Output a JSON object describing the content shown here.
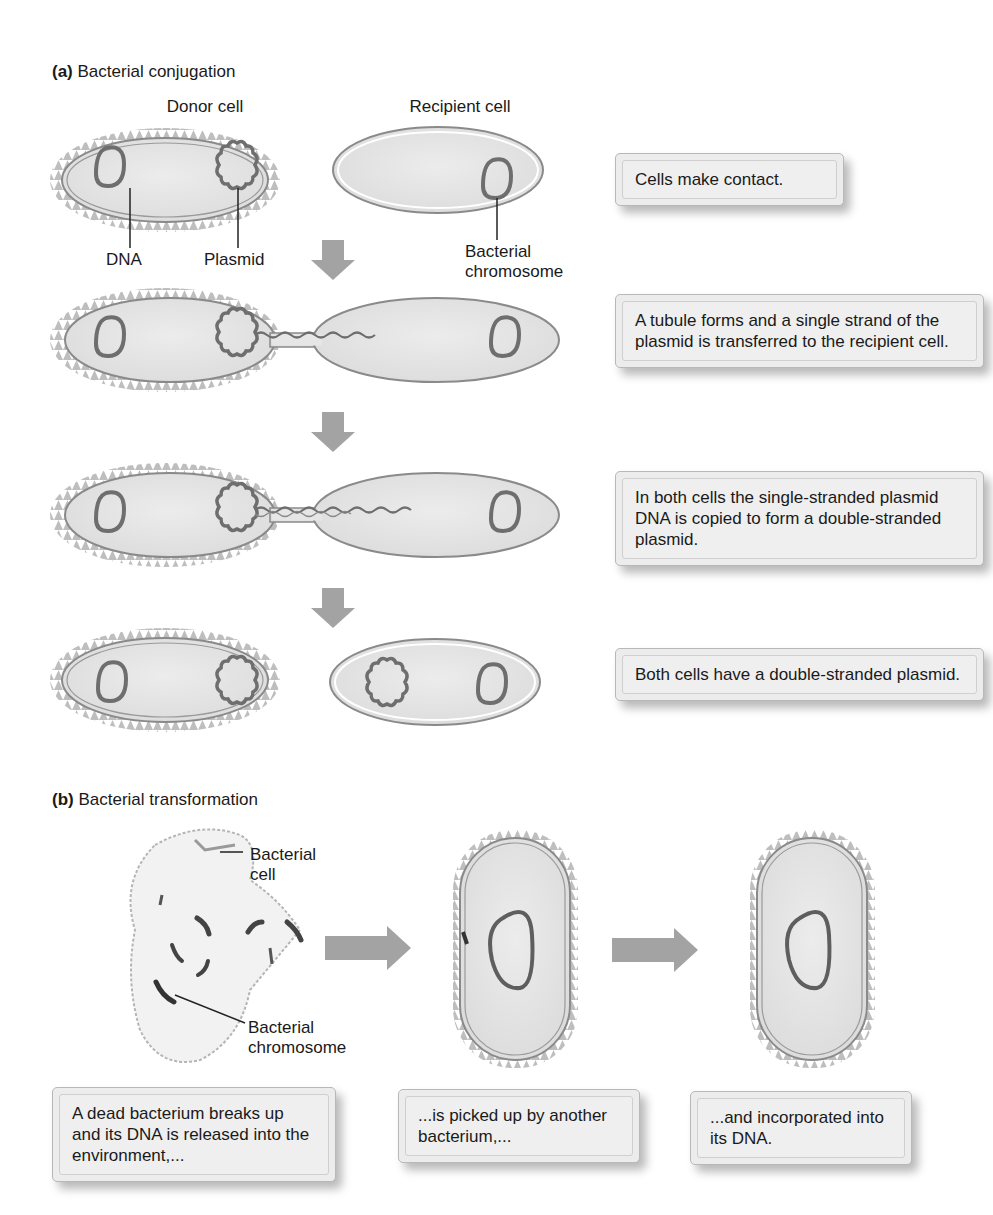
{
  "figure": {
    "colors": {
      "cell_fill": "#e4e4e4",
      "cell_wall": "#8a8a8a",
      "pili": "#b0b0b0",
      "dna": "#6e6e6e",
      "arrow": "#a3a3a3",
      "caption_bg": "#ececec",
      "text": "#1a1a1a"
    },
    "panel_a": {
      "letter": "(a)",
      "title": "Bacterial conjugation",
      "column_labels": {
        "donor": "Donor cell",
        "recipient": "Recipient cell"
      },
      "labels": {
        "dna": "DNA",
        "plasmid": "Plasmid",
        "bacterial_chromosome_line1": "Bacterial",
        "bacterial_chromosome_line2": "chromosome"
      },
      "steps": [
        {
          "caption": "Cells make contact."
        },
        {
          "caption": "A tubule forms and a single strand of the plasmid is transferred to the recipient cell."
        },
        {
          "caption": "In both cells the single-stranded plasmid DNA is copied to form a double-stranded plasmid."
        },
        {
          "caption": "Both cells have a double-stranded plasmid."
        }
      ]
    },
    "panel_b": {
      "letter": "(b)",
      "title": "Bacterial transformation",
      "labels": {
        "bacterial_cell_line1": "Bacterial",
        "bacterial_cell_line2": "cell",
        "bacterial_chromosome_line1": "Bacterial",
        "bacterial_chromosome_line2": "chromosome"
      },
      "steps": [
        {
          "caption": "A dead bacterium breaks up and its DNA is released into the environment,..."
        },
        {
          "caption": "...is picked up by another bacterium,..."
        },
        {
          "caption": "...and incorporated into its DNA."
        }
      ]
    }
  }
}
